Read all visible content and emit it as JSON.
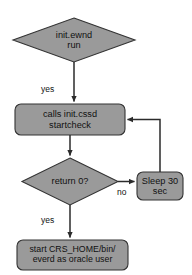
{
  "diagram": {
    "background_color": "#ffffff",
    "node_fill_color": "#9a9a9a",
    "node_stroke_color": "#333333",
    "text_color": "#111111",
    "nodes": {
      "start": {
        "shape": "diamond",
        "line1": "init.ewnd",
        "line2": "run"
      },
      "call_check": {
        "shape": "rounded-rect",
        "line1": "calls init.cssd",
        "line2": "startcheck"
      },
      "decision": {
        "shape": "diamond",
        "line1": "return 0?",
        "line2": ""
      },
      "sleep": {
        "shape": "rounded-rect",
        "line1": "Sleep 30",
        "line2": "sec"
      },
      "start_crs": {
        "shape": "rounded-rect",
        "line1": "start CRS_HOME/bin/",
        "line2": "everd as oracle user"
      }
    },
    "edge_labels": {
      "yes_top": "yes",
      "yes_bottom": "yes",
      "no": "no"
    }
  }
}
